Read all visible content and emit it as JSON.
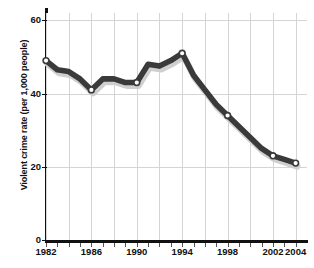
{
  "chart_data": {
    "type": "line",
    "title": "",
    "xlabel": "",
    "ylabel": "Violent crime rate (per 1,000 people)",
    "x": [
      1982,
      1983,
      1984,
      1985,
      1986,
      1987,
      1988,
      1989,
      1990,
      1991,
      1992,
      1993,
      1994,
      1995,
      1996,
      1997,
      1998,
      1999,
      2000,
      2001,
      2002,
      2003,
      2004
    ],
    "values": [
      49,
      46.5,
      46,
      44,
      41,
      44,
      44,
      43,
      43,
      48,
      47.5,
      49,
      51,
      45,
      41,
      37,
      34,
      31,
      28,
      25,
      23,
      22,
      21
    ],
    "markers": [
      {
        "x": 1982,
        "y": 49
      },
      {
        "x": 1986,
        "y": 41
      },
      {
        "x": 1990,
        "y": 43
      },
      {
        "x": 1994,
        "y": 51
      },
      {
        "x": 1998,
        "y": 34
      },
      {
        "x": 2002,
        "y": 23
      },
      {
        "x": 2004,
        "y": 21
      }
    ],
    "xlim": [
      1982,
      2005
    ],
    "ylim": [
      0,
      62
    ],
    "ytick_values": [
      0,
      20,
      40,
      60
    ],
    "ytick_labels": [
      "0",
      "20",
      "40",
      "60"
    ],
    "xtick_values": [
      1982,
      1986,
      1990,
      1994,
      1998,
      2002,
      2004
    ],
    "xtick_labels": [
      "1982",
      "1986",
      "1990",
      "1994",
      "1998",
      "2002",
      "2004"
    ],
    "gridlines_x": [
      1982,
      1984,
      1986,
      1988,
      1990,
      1992,
      1994,
      1996,
      1998,
      2000,
      2002,
      2004
    ],
    "grid": true,
    "legend": null,
    "line_color": "#3a3a3a",
    "shadow_color": "#cfcfcf",
    "grid_color": "#d5d5d5",
    "axis_color": "#111111",
    "marker_fill": "#ffffff"
  }
}
